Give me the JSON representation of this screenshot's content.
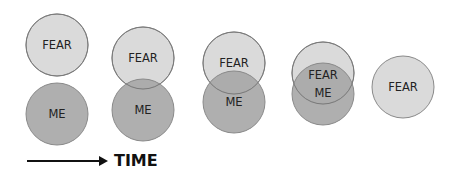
{
  "diagram": {
    "title": "",
    "colors": {
      "fear_fill": "#dadada",
      "me_fill": "#a8a8a8",
      "overlap_fill": "#9c9c9c",
      "stroke": "#8a8a8a",
      "text": "#222222",
      "arrow": "#111111"
    },
    "radius": 31,
    "stages": [
      {
        "fear": {
          "label": "FEAR",
          "cx": 57,
          "cy": 45
        },
        "me": {
          "label": "ME",
          "cx": 57,
          "cy": 114
        }
      },
      {
        "fear": {
          "label": "FEAR",
          "cx": 143,
          "cy": 58
        },
        "me": {
          "label": "ME",
          "cx": 143,
          "cy": 110
        }
      },
      {
        "fear": {
          "label": "FEAR",
          "cx": 234,
          "cy": 63
        },
        "me": {
          "label": "ME",
          "cx": 234,
          "cy": 102
        }
      },
      {
        "fear": {
          "label": "FEAR",
          "cx": 323,
          "cy": 73
        },
        "me": {
          "label": "ME",
          "cx": 323,
          "cy": 94
        }
      },
      {
        "fear": {
          "label": "FEAR",
          "cx": 403,
          "cy": 87
        }
      }
    ],
    "axis": {
      "label": "TIME",
      "arrow_x1": 27,
      "arrow_x2": 108,
      "arrow_y": 161
    }
  }
}
